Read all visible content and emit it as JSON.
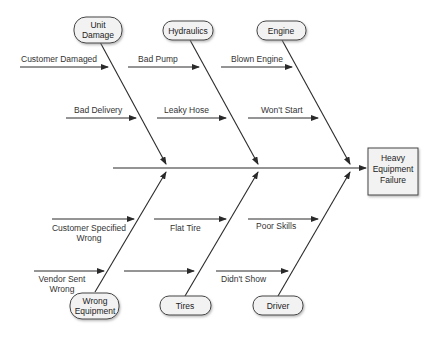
{
  "diagram": {
    "type": "fishbone",
    "effect": {
      "lines": [
        "Heavy",
        "Equipment",
        "Failure"
      ]
    },
    "categories": {
      "top": [
        {
          "name": "Unit Damage",
          "lines": [
            "Unit",
            "Damage"
          ],
          "causes": [
            "Customer Damaged",
            "Bad Delivery"
          ]
        },
        {
          "name": "Hydraulics",
          "lines": [
            "Hydraulics"
          ],
          "causes": [
            "Bad Pump",
            "Leaky Hose"
          ]
        },
        {
          "name": "Engine",
          "lines": [
            "Engine"
          ],
          "causes": [
            "Blown Engine",
            "Won't Start"
          ]
        }
      ],
      "bottom": [
        {
          "name": "Wrong Equipment",
          "lines": [
            "Wrong",
            "Equipment"
          ],
          "causes": [
            [
              "Customer Specified",
              "Wrong"
            ],
            [
              "Vendor Sent",
              "Wrong"
            ]
          ]
        },
        {
          "name": "Tires",
          "lines": [
            "Tires"
          ],
          "causes": [
            [
              "Flat Tire"
            ],
            [
              ""
            ]
          ]
        },
        {
          "name": "Driver",
          "lines": [
            "Driver"
          ],
          "causes": [
            [
              "Poor Skills"
            ],
            [
              "Didn't Show"
            ]
          ]
        }
      ]
    },
    "colors": {
      "line": "#2a2a2a",
      "node_fill": "#f2f2f2",
      "node_stroke": "#444444",
      "text": "#333333"
    }
  }
}
